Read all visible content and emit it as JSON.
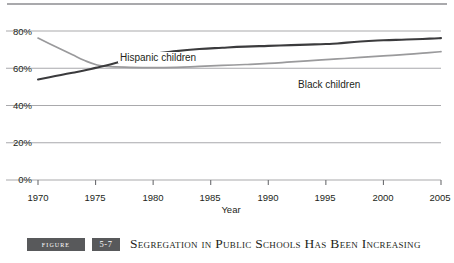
{
  "figure": {
    "tag_label": "Figure",
    "number": "5-7",
    "title": "Segregation in Public Schools Has Been Increasing"
  },
  "colors": {
    "dark_series": "#3b3b3d",
    "light_series": "#9a9a9c",
    "gridline": "#a9a9ac",
    "axis": "#6d6e71",
    "text": "#231f20",
    "caption_bar": "#58595b"
  },
  "chart_data": {
    "type": "line",
    "title": "",
    "xlabel": "Year",
    "ylabel": "",
    "xlim": [
      1970,
      2005
    ],
    "ylim": [
      0,
      80
    ],
    "grid": true,
    "legend_position": "inline-labels",
    "xticks": [
      "1970",
      "1975",
      "1980",
      "1985",
      "1990",
      "1995",
      "2000",
      "2005"
    ],
    "xtick_values": [
      1970,
      1975,
      1980,
      1985,
      1990,
      1995,
      2000,
      2005
    ],
    "yticks": [
      "0%",
      "20%",
      "40%",
      "60%",
      "80%"
    ],
    "ytick_values": [
      0,
      20,
      40,
      60,
      80
    ],
    "x": [
      1970,
      1971,
      1972,
      1973,
      1974,
      1975,
      1976,
      1978,
      1980,
      1982,
      1984,
      1986,
      1988,
      1990,
      1992,
      1994,
      1995,
      1996,
      1998,
      2000,
      2002,
      2004,
      2005
    ],
    "series": [
      {
        "name": "Hispanic children",
        "color": "#3b3b3d",
        "label_x": 118,
        "label_y": 38,
        "values": [
          54.0,
          55.2,
          56.4,
          57.6,
          58.8,
          60.2,
          61.6,
          64.8,
          67.6,
          69.2,
          70.3,
          71.0,
          71.6,
          72.0,
          72.4,
          72.8,
          73.0,
          73.3,
          74.4,
          75.0,
          75.4,
          75.9,
          76.2
        ]
      },
      {
        "name": "Black children",
        "color": "#9a9a9c",
        "label_x": 296,
        "label_y": 65,
        "values": [
          76.2,
          73.2,
          70.2,
          67.2,
          64.3,
          62.0,
          61.0,
          60.5,
          60.3,
          60.5,
          61.0,
          61.5,
          62.0,
          62.6,
          63.4,
          64.2,
          64.6,
          65.0,
          65.8,
          66.6,
          67.4,
          68.4,
          68.9
        ]
      }
    ],
    "annotations": [
      {
        "text": "Hispanic children",
        "x": 1978,
        "y": 77
      },
      {
        "text": "Black children",
        "x": 1993,
        "y": 62
      }
    ]
  }
}
